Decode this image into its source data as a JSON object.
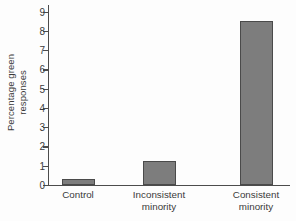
{
  "chart_data": {
    "type": "bar",
    "title": "",
    "xlabel": "",
    "ylabel": "Percentage green responses",
    "ylabel_line1": "Percentage green",
    "ylabel_line2": "responses",
    "categories": [
      "Control",
      "Inconsistent minority",
      "Consistent minority"
    ],
    "category_lines": [
      [
        "Control",
        ""
      ],
      [
        "Inconsistent",
        "minority"
      ],
      [
        "Consistent",
        "minority"
      ]
    ],
    "values": [
      0.3,
      1.25,
      8.5
    ],
    "ylim": [
      0,
      9.4
    ],
    "yticks": [
      0,
      1,
      2,
      3,
      4,
      5,
      6,
      7,
      8,
      9
    ],
    "ytick_labels": [
      "0",
      "1",
      "2",
      "3",
      "4",
      "5",
      "6",
      "7",
      "8",
      "9"
    ],
    "grid": false,
    "legend": null,
    "bar_color": "#7d7d7d",
    "bar_edge_color": "#4a4a4a",
    "axis_color": "#4c4c4c",
    "background_color": "#ffffff"
  }
}
